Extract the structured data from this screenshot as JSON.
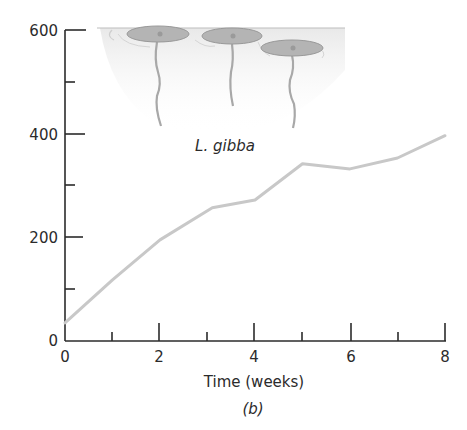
{
  "chart_data": {
    "type": "line",
    "title": "",
    "panel_label": "(b)",
    "annotation": "L. gibba",
    "xlabel": "Time (weeks)",
    "ylabel": "",
    "xlim": [
      0,
      8
    ],
    "ylim": [
      0,
      600
    ],
    "x_ticks_major": [
      0,
      2,
      4,
      6,
      8
    ],
    "x_ticks_minor": [
      1,
      3,
      5,
      7
    ],
    "y_ticks_major": [
      0,
      200,
      400,
      600
    ],
    "y_ticks_minor": [
      100,
      300,
      500
    ],
    "grid": false,
    "legend": null,
    "series": [
      {
        "name": "L. gibba",
        "color": "#c8c8c8",
        "x": [
          0,
          1,
          2,
          3.1,
          4,
          5,
          6,
          7,
          8
        ],
        "values": [
          35,
          118,
          195,
          257,
          272,
          342,
          332,
          353,
          396
        ]
      }
    ],
    "illustration": "three duckweed (Lemna gibba) fronds floating at water surface with hanging roots"
  },
  "labels": {
    "y_tick_0": "0",
    "y_tick_200": "200",
    "y_tick_400": "400",
    "y_tick_600": "600",
    "x_tick_0": "0",
    "x_tick_2": "2",
    "x_tick_4": "4",
    "x_tick_6": "6",
    "x_tick_8": "8",
    "x_axis_title": "Time (weeks)",
    "species": "L. gibba",
    "panel": "(b)"
  },
  "colors": {
    "axis": "#2b2b2b",
    "line": "#c8c8c8",
    "frond_fill": "#b4b4b4",
    "frond_stroke": "#999999",
    "root": "#a8a8a8",
    "water": "#ededed"
  }
}
